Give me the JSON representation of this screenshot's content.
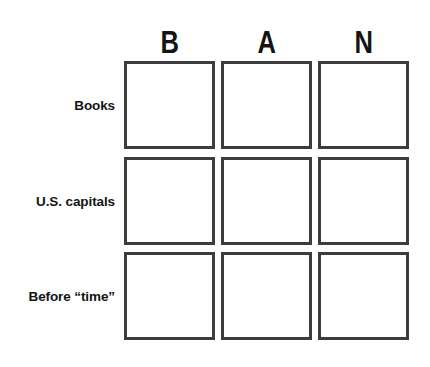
{
  "grid": {
    "column_headers": [
      "B",
      "A",
      "N"
    ],
    "row_labels": [
      "Books",
      "U.S. capitals",
      "Before “time”"
    ],
    "cells": [
      [
        "",
        "",
        ""
      ],
      [
        "",
        "",
        ""
      ],
      [
        "",
        "",
        ""
      ]
    ],
    "colors": {
      "background": "#ffffff",
      "cell_border": "#3c3c3c",
      "text": "#141414"
    }
  }
}
